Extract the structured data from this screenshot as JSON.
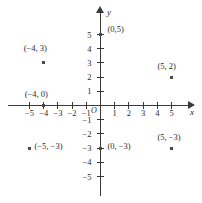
{
  "figure": {
    "kind": "cartesian-coordinate-plane",
    "origin_label": "O",
    "x_axis_name": "x",
    "y_axis_name": "y"
  },
  "chart_data": {
    "type": "scatter",
    "title": "",
    "xlabel": "x",
    "ylabel": "y",
    "xlim": [
      -5.8,
      5.8
    ],
    "ylim": [
      -5.8,
      5.8
    ],
    "grid": false,
    "legend": "none",
    "x_ticks": [
      -5,
      -4,
      -3,
      -2,
      -1,
      1,
      2,
      3,
      4,
      5
    ],
    "y_ticks": [
      5,
      4,
      3,
      2,
      1,
      -1,
      -2,
      -3,
      -4,
      -5
    ],
    "x_tick_labels": [
      "−5",
      "−4",
      "−3",
      "−2",
      "−1",
      "1",
      "2",
      "3",
      "4",
      "5"
    ],
    "y_tick_labels": [
      "5",
      "4",
      "3",
      "2",
      "1",
      "−1",
      "−2",
      "−3",
      "−4",
      "−5"
    ],
    "points": [
      {
        "x": 0,
        "y": 5,
        "label": "(0,5)",
        "label_dx": 7,
        "label_dy": -11
      },
      {
        "x": -4,
        "y": 3,
        "label": "(−4, 3)",
        "label_dx": -20,
        "label_dy": -20
      },
      {
        "x": 5,
        "y": 2,
        "label": "(5, 2)",
        "label_dx": -14,
        "label_dy": -16
      },
      {
        "x": -4,
        "y": 0,
        "label": "(−4, 0)",
        "label_dx": -19,
        "label_dy": -17
      },
      {
        "x": -5,
        "y": -3,
        "label": "(−5, −3)",
        "label_dx": 5,
        "label_dy": -7
      },
      {
        "x": 0,
        "y": -3,
        "label": "(0, −3)",
        "label_dx": 7,
        "label_dy": -7
      },
      {
        "x": 5,
        "y": -3,
        "label": "(5, −3)",
        "label_dx": -14,
        "label_dy": -16
      }
    ]
  },
  "colors": {
    "axis": "#3a3a3a",
    "point": "#4a4a4a",
    "text": "#2b2b2b",
    "background": "#ffffff"
  }
}
